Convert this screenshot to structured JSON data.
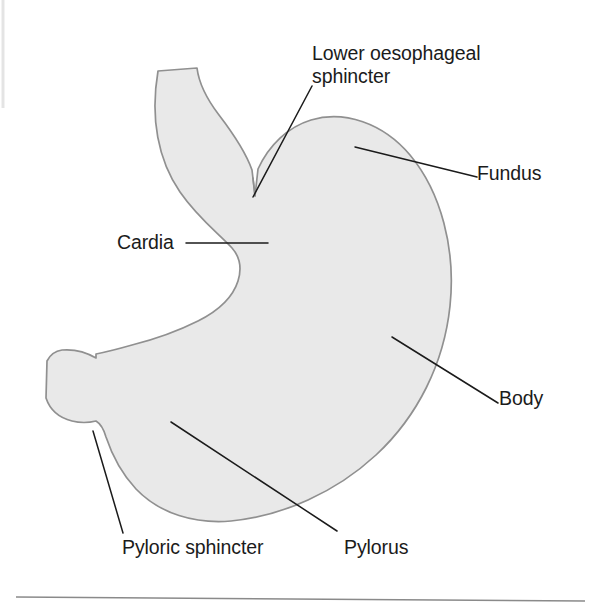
{
  "figure": {
    "background_color": "#ffffff",
    "organ_fill_color": "#e9e9e9",
    "organ_outline_color": "#909090",
    "leader_line_color": "#1b1b1b",
    "text_color": "#1b1b1b",
    "rule_color": "#8a8a8a"
  },
  "labels": {
    "lower_oesophageal_sphincter": "Lower oesophageal\nsphincter",
    "fundus": "Fundus",
    "cardia": "Cardia",
    "body": "Body",
    "pyloric_sphincter": "Pyloric sphincter",
    "pylorus": "Pylorus"
  },
  "annotations": [
    {
      "id": "lower-oesophageal-sphincter",
      "label": "Lower oesophageal sphincter",
      "text_position": [
        312,
        42
      ],
      "leader_from": [
        312,
        86
      ],
      "leader_to": [
        253,
        197
      ]
    },
    {
      "id": "fundus",
      "label": "Fundus",
      "text_position": [
        477,
        162
      ],
      "leader_from": [
        477,
        177
      ],
      "leader_to": [
        355,
        147
      ]
    },
    {
      "id": "cardia",
      "label": "Cardia",
      "text_position": [
        117,
        231
      ],
      "leader_from": [
        186,
        243
      ],
      "leader_to": [
        268,
        243
      ]
    },
    {
      "id": "body",
      "label": "Body",
      "text_position": [
        499,
        387
      ],
      "leader_from": [
        498,
        403
      ],
      "leader_to": [
        392,
        337
      ]
    },
    {
      "id": "pyloric-sphincter",
      "label": "Pyloric sphincter",
      "text_position": [
        122,
        536
      ],
      "leader_from": [
        123,
        533
      ],
      "leader_to": [
        93,
        431
      ]
    },
    {
      "id": "pylorus",
      "label": "Pylorus",
      "text_position": [
        344,
        536
      ],
      "leader_from": [
        337,
        531
      ],
      "leader_to": [
        171,
        422
      ]
    }
  ],
  "footer_rule": {
    "x1": 16,
    "y1": 597,
    "x2": 585,
    "y2": 601
  }
}
